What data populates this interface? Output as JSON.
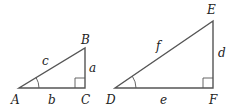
{
  "figure": {
    "line_color": "#555555",
    "text_color": "#222222"
  },
  "triangle_abc": {
    "vertices": {
      "A": "A",
      "B": "B",
      "C": "C"
    },
    "sides": {
      "a": "a",
      "b": "b",
      "c": "c"
    },
    "right_angle_at": "C",
    "marked_angle_at": "A"
  },
  "triangle_def": {
    "vertices": {
      "D": "D",
      "E": "E",
      "F": "F"
    },
    "sides": {
      "d": "d",
      "e": "e",
      "f": "f"
    },
    "right_angle_at": "F",
    "marked_angle_at": "D"
  }
}
